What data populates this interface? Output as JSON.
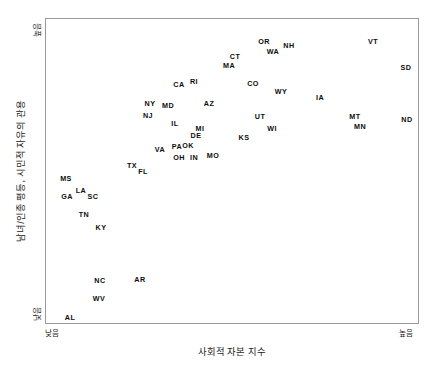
{
  "chart_data": {
    "type": "scatter",
    "title": "",
    "xlabel": "사회적 자본 지수",
    "ylabel": "남녀/인종 평등, 시민적 자유의 관용",
    "xlim": [
      "낮음",
      "높음"
    ],
    "ylim": [
      "낮음",
      "높음"
    ],
    "x_tick_labels": [
      "낮음",
      "높음"
    ],
    "y_tick_labels": [
      "낮음",
      "높음"
    ],
    "grid": false,
    "legend": "none",
    "point_marker": "text-label-only",
    "points": [
      {
        "label": "VT",
        "px": 373,
        "py": 42
      },
      {
        "label": "OR",
        "px": 264,
        "py": 42
      },
      {
        "label": "NH",
        "px": 289,
        "py": 46
      },
      {
        "label": "WA",
        "px": 273,
        "py": 52
      },
      {
        "label": "CT",
        "px": 235,
        "py": 57
      },
      {
        "label": "SD",
        "px": 406,
        "py": 68
      },
      {
        "label": "MA",
        "px": 229,
        "py": 66
      },
      {
        "label": "CO",
        "px": 253,
        "py": 84
      },
      {
        "label": "RI",
        "px": 194,
        "py": 82
      },
      {
        "label": "CA",
        "px": 179,
        "py": 85
      },
      {
        "label": "WY",
        "px": 281,
        "py": 92
      },
      {
        "label": "IA",
        "px": 320,
        "py": 98
      },
      {
        "label": "AZ",
        "px": 209,
        "py": 104
      },
      {
        "label": "NY",
        "px": 150,
        "py": 104
      },
      {
        "label": "MD",
        "px": 168,
        "py": 106
      },
      {
        "label": "NJ",
        "px": 148,
        "py": 116
      },
      {
        "label": "UT",
        "px": 260,
        "py": 117
      },
      {
        "label": "MT",
        "px": 355,
        "py": 117
      },
      {
        "label": "ND",
        "px": 407,
        "py": 120
      },
      {
        "label": "IL",
        "px": 175,
        "py": 124
      },
      {
        "label": "MN",
        "px": 360,
        "py": 127
      },
      {
        "label": "WI",
        "px": 272,
        "py": 129
      },
      {
        "label": "MI",
        "px": 200,
        "py": 129
      },
      {
        "label": "DE",
        "px": 196,
        "py": 136
      },
      {
        "label": "KS",
        "px": 244,
        "py": 138
      },
      {
        "label": "VA",
        "px": 160,
        "py": 150
      },
      {
        "label": "PA",
        "px": 177,
        "py": 147
      },
      {
        "label": "OK",
        "px": 188,
        "py": 146
      },
      {
        "label": "OH",
        "px": 179,
        "py": 158
      },
      {
        "label": "IN",
        "px": 194,
        "py": 158
      },
      {
        "label": "MO",
        "px": 213,
        "py": 156
      },
      {
        "label": "TX",
        "px": 132,
        "py": 166
      },
      {
        "label": "FL",
        "px": 143,
        "py": 172
      },
      {
        "label": "MS",
        "px": 66,
        "py": 179
      },
      {
        "label": "LA",
        "px": 81,
        "py": 191
      },
      {
        "label": "GA",
        "px": 67,
        "py": 197
      },
      {
        "label": "SC",
        "px": 93,
        "py": 197
      },
      {
        "label": "TN",
        "px": 84,
        "py": 215
      },
      {
        "label": "KY",
        "px": 101,
        "py": 228
      },
      {
        "label": "NC",
        "px": 100,
        "py": 281
      },
      {
        "label": "AR",
        "px": 140,
        "py": 280
      },
      {
        "label": "WV",
        "px": 99,
        "py": 299
      },
      {
        "label": "AL",
        "px": 70,
        "py": 318
      }
    ]
  },
  "axes": {
    "y_title": "남녀/인종 평등, 시민적 자유의 관용",
    "x_title": "사회적 자본 지수",
    "y_high": "높음",
    "y_low": "낮음",
    "x_low": "낮음",
    "x_high": "높음"
  },
  "colors": {
    "background": "#ffffff",
    "frame": "#9a9a9a",
    "label_text": "#0d0d0d",
    "axis_text": "#1b1b1b"
  }
}
